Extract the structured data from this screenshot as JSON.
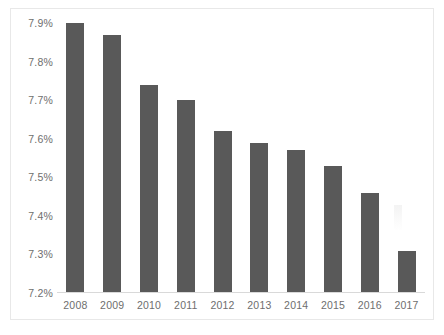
{
  "chart_data": {
    "type": "bar",
    "title": "",
    "xlabel": "",
    "ylabel": "",
    "categories": [
      "2008",
      "2009",
      "2010",
      "2011",
      "2012",
      "2013",
      "2014",
      "2015",
      "2016",
      "2017"
    ],
    "values": [
      7.9,
      7.87,
      7.74,
      7.7,
      7.62,
      7.59,
      7.57,
      7.53,
      7.46,
      7.31
    ],
    "value_labels": [
      "7.90%",
      "7.87%",
      "7.74%",
      "7.70%",
      "7.62%",
      "7.59%",
      "7.57%",
      "7.53%",
      "7.46%",
      "7.31%"
    ],
    "ylim": [
      7.2,
      7.9
    ],
    "ytick_labels": [
      "7.9%",
      "7.8%",
      "7.7%",
      "7.6%",
      "7.5%",
      "7.4%",
      "7.3%",
      "7.2%"
    ],
    "ytick_values": [
      7.9,
      7.8,
      7.7,
      7.6,
      7.5,
      7.4,
      7.3,
      7.2
    ],
    "grid": false,
    "legend": null,
    "series_color": "#595959",
    "axis_color": "#d9d9d9",
    "tick_text_color": "#6e6e6e",
    "background": "#ffffff"
  }
}
